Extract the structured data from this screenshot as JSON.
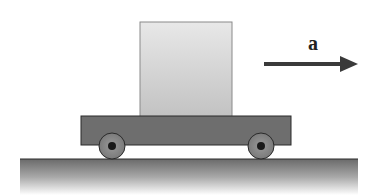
{
  "diagram": {
    "title": "",
    "acceleration": {
      "label": "a",
      "direction": "right",
      "color": "#3a3a3a"
    },
    "block": {
      "fill_top": "#e6e6e6",
      "fill_bottom": "#c4c4c4",
      "stroke": "#8a8a8a"
    },
    "cart": {
      "fill": "#6e6e6e",
      "stroke": "#2a2a2a",
      "wheels": [
        {
          "name": "left-wheel",
          "cx": 112,
          "cy": 146
        },
        {
          "name": "right-wheel",
          "cx": 261,
          "cy": 146
        }
      ],
      "wheel_fill": "#8c8c8c",
      "hub_fill": "#1a1a1a"
    },
    "ground": {
      "top_color": "#6a6a6a",
      "bottom_color": "#ffffff",
      "stroke": "#2a2a2a"
    }
  }
}
